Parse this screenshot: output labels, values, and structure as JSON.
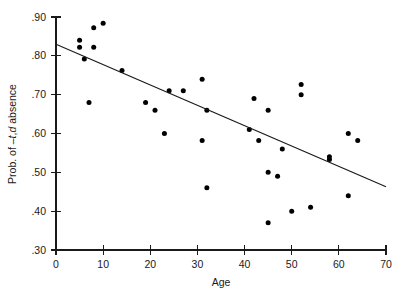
{
  "chart_data": {
    "type": "scatter",
    "title": "",
    "xlabel": "Age",
    "ylabel": "Prob. of –t,d absence",
    "ylabel_parts": {
      "prefix": "Prob. of –",
      "italic1": "t",
      "comma": ",",
      "italic2": "d",
      "suffix": " absence"
    },
    "xlim": [
      0,
      70
    ],
    "ylim": [
      0.3,
      0.9
    ],
    "xticks": [
      0,
      10,
      20,
      30,
      40,
      50,
      60,
      70
    ],
    "xticklabels": [
      "0",
      "10",
      "20",
      "30",
      "40",
      "50",
      "60",
      "70"
    ],
    "yticks": [
      0.3,
      0.4,
      0.5,
      0.6,
      0.7,
      0.8,
      0.9
    ],
    "yticklabels": [
      ".30",
      ".40",
      ".50",
      ".60",
      ".70",
      ".80",
      ".90"
    ],
    "grid": false,
    "legend": null,
    "marker": "filled-circle",
    "marker_color": "#000000",
    "points": [
      {
        "x": 5,
        "y": 0.84
      },
      {
        "x": 5,
        "y": 0.822
      },
      {
        "x": 6,
        "y": 0.792
      },
      {
        "x": 7,
        "y": 0.68
      },
      {
        "x": 8,
        "y": 0.872
      },
      {
        "x": 8,
        "y": 0.822
      },
      {
        "x": 10,
        "y": 0.884
      },
      {
        "x": 14,
        "y": 0.762
      },
      {
        "x": 19,
        "y": 0.68
      },
      {
        "x": 21,
        "y": 0.66
      },
      {
        "x": 23,
        "y": 0.6
      },
      {
        "x": 24,
        "y": 0.71
      },
      {
        "x": 27,
        "y": 0.71
      },
      {
        "x": 31,
        "y": 0.74
      },
      {
        "x": 31,
        "y": 0.582
      },
      {
        "x": 32,
        "y": 0.66
      },
      {
        "x": 32,
        "y": 0.46
      },
      {
        "x": 41,
        "y": 0.61
      },
      {
        "x": 42,
        "y": 0.69
      },
      {
        "x": 43,
        "y": 0.582
      },
      {
        "x": 45,
        "y": 0.66
      },
      {
        "x": 45,
        "y": 0.5
      },
      {
        "x": 45,
        "y": 0.37
      },
      {
        "x": 47,
        "y": 0.49
      },
      {
        "x": 48,
        "y": 0.56
      },
      {
        "x": 50,
        "y": 0.4
      },
      {
        "x": 52,
        "y": 0.726
      },
      {
        "x": 52,
        "y": 0.7
      },
      {
        "x": 54,
        "y": 0.41
      },
      {
        "x": 58,
        "y": 0.54
      },
      {
        "x": 58,
        "y": 0.533
      },
      {
        "x": 62,
        "y": 0.6
      },
      {
        "x": 62,
        "y": 0.44
      },
      {
        "x": 64,
        "y": 0.582
      }
    ],
    "fit_line": {
      "type": "linear-regression",
      "x_start": 0,
      "y_start": 0.83,
      "x_end": 70,
      "y_end": 0.463
    }
  }
}
